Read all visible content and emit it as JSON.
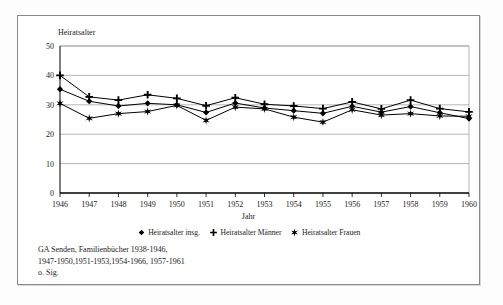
{
  "chart_data": {
    "type": "line",
    "title": "",
    "ylabel": "Heiratsalter",
    "xlabel": "Jahr",
    "ylim": [
      0,
      50
    ],
    "yticks": [
      0,
      10,
      20,
      30,
      40,
      50
    ],
    "grid": true,
    "legend_position": "bottom",
    "categories": [
      "1946",
      "1947",
      "1948",
      "1949",
      "1950",
      "1951",
      "1952",
      "1953",
      "1954",
      "1955",
      "1956",
      "1957",
      "1958",
      "1959",
      "1960"
    ],
    "series": [
      {
        "name": "Heiratsalter insg.",
        "marker": "diamond",
        "values": [
          35.3,
          31.2,
          29.6,
          30.5,
          30.0,
          27.4,
          30.6,
          28.9,
          28.0,
          27.1,
          29.5,
          27.5,
          29.4,
          27.3,
          25.3
        ]
      },
      {
        "name": "Heiratsalter Männer",
        "marker": "plus",
        "values": [
          40.0,
          32.7,
          31.6,
          33.4,
          32.2,
          29.7,
          32.4,
          30.2,
          29.6,
          28.7,
          31.0,
          28.6,
          31.6,
          28.7,
          27.6
        ]
      },
      {
        "name": "Heiratsalter Frauen",
        "marker": "star",
        "values": [
          30.5,
          25.4,
          27.0,
          27.7,
          29.8,
          24.7,
          29.2,
          28.6,
          25.8,
          24.1,
          28.3,
          26.5,
          27.0,
          26.2,
          26.1
        ]
      }
    ]
  },
  "axes": {
    "y_title": "Heiratsalter",
    "x_title": "Jahr",
    "y_ticks": [
      "50",
      "40",
      "30",
      "20",
      "10",
      "0"
    ],
    "x_ticks": [
      "1946",
      "1947",
      "1948",
      "1949",
      "1950",
      "1951",
      "1952",
      "1953",
      "1954",
      "1955",
      "1956",
      "1957",
      "1958",
      "1959",
      "1960"
    ]
  },
  "legend": {
    "items": [
      {
        "label": "Heiratsalter insg.",
        "marker": "diamond-marker"
      },
      {
        "label": "Heiratsalter Männer",
        "marker": "plus-marker"
      },
      {
        "label": "Heiratsalter Frauen",
        "marker": "star-marker"
      }
    ]
  },
  "footnote": {
    "lines": [
      "GA Senden, Familienbücher    1938-1946,",
      "1947-1950,1951-1953,1954-1966, 1957-1961",
      "o. Sig."
    ]
  },
  "colors": {
    "line": "#000000",
    "grid": "#9a9a9a",
    "axis": "#000000",
    "frame": "#8a8a8a",
    "background": "#ffffff"
  }
}
